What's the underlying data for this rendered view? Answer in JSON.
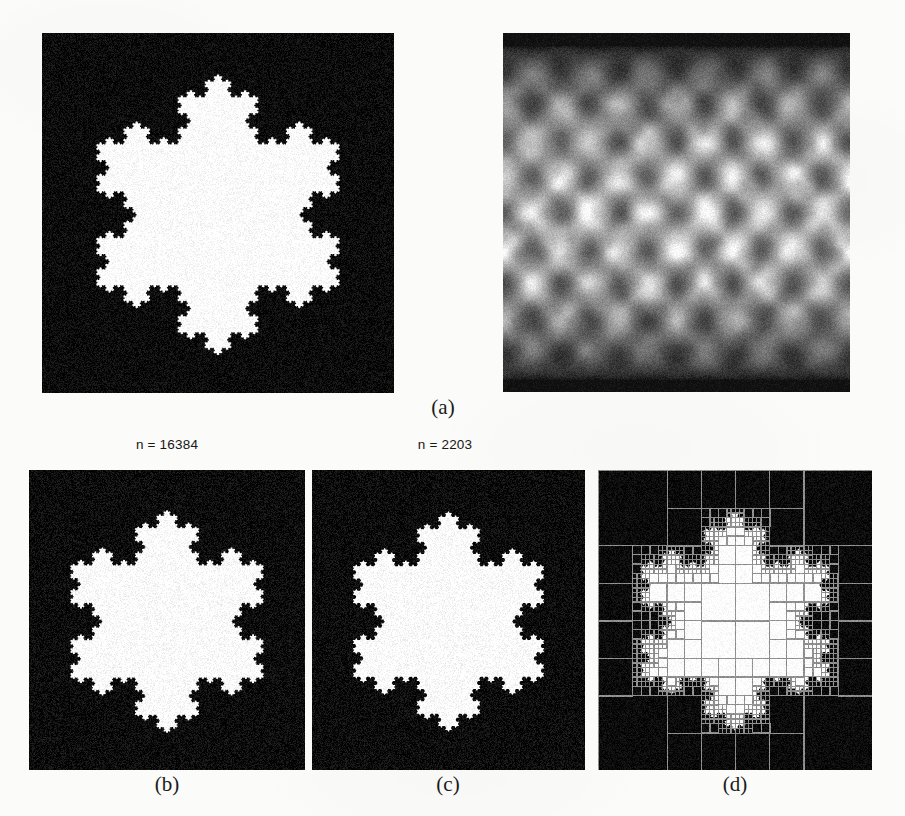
{
  "figure": {
    "kind": "multi-panel-scientific-figure",
    "background_color": "#fbfbf9",
    "panel_background_color": "#0b0b0b",
    "foreground_color": "#ffffff",
    "grid_color": "#8f8f8f"
  },
  "captions": {
    "a": "(a)",
    "b": "(b)",
    "c": "(c)",
    "d": "(d)"
  },
  "labels": {
    "n_b": "n = 16384",
    "n_c": "n = 2203"
  },
  "panels": [
    {
      "id": "panel-a-binary",
      "caption": "(a)",
      "content": "koch-snowflake-binary",
      "description": "Binary Koch snowflake, white interior on black background",
      "fill": "#ffffff",
      "background": "#0b0b0b",
      "koch_iterations": 5,
      "radius_fraction": 0.4,
      "rotation_deg": 0
    },
    {
      "id": "panel-a-gray",
      "caption": "(a)",
      "content": "grayscale-interference-pattern",
      "description": "Noisy grayscale lattice / diamond interference pattern, bright band across the middle, dark bands at top and bottom",
      "background": "#0b0b0b",
      "lattice_cols": 6,
      "lattice_rows": 5,
      "noise_amplitude": 0.12,
      "vertical_envelope": "bright-center-dark-edges"
    },
    {
      "id": "panel-b",
      "caption": "(b)",
      "label": "n = 16384",
      "n": 16384,
      "content": "koch-snowflake-binary",
      "description": "Reconstruction of the snowflake using n = 16384 coefficients",
      "fill": "#ffffff",
      "background": "#0b0b0b",
      "koch_iterations": 5,
      "radius_fraction": 0.405,
      "rotation_deg": 0
    },
    {
      "id": "panel-c",
      "caption": "(c)",
      "label": "n = 2203",
      "n": 2203,
      "content": "koch-snowflake-binary",
      "description": "Reconstruction of the snowflake using n = 2203 coefficients",
      "fill": "#ffffff",
      "background": "#0b0b0b",
      "koch_iterations": 4,
      "radius_fraction": 0.405,
      "rotation_deg": 0
    },
    {
      "id": "panel-d",
      "caption": "(d)",
      "content": "koch-snowflake-with-quadtree",
      "description": "Snowflake overlaid with an adaptive quadtree mesh: coarse cells in uniform regions, finely subdivided cells along the fractal boundary",
      "fill": "#ffffff",
      "background": "#0b0b0b",
      "grid_color": "#8f8f8f",
      "koch_iterations": 4,
      "radius_fraction": 0.4,
      "quadtree_min_level": 2,
      "quadtree_max_level": 6
    }
  ],
  "chart_data": {
    "type": "heatmap",
    "title": "",
    "xlabel": "",
    "ylabel": "",
    "panel_labels": [
      "(a)",
      "(b)",
      "(c)",
      "(d)"
    ],
    "annotations": [
      "n = 16384",
      "n = 2203"
    ],
    "series": [
      {
        "name": "n = 16384",
        "values": [
          16384
        ]
      },
      {
        "name": "n = 2203",
        "values": [
          2203
        ]
      }
    ]
  }
}
